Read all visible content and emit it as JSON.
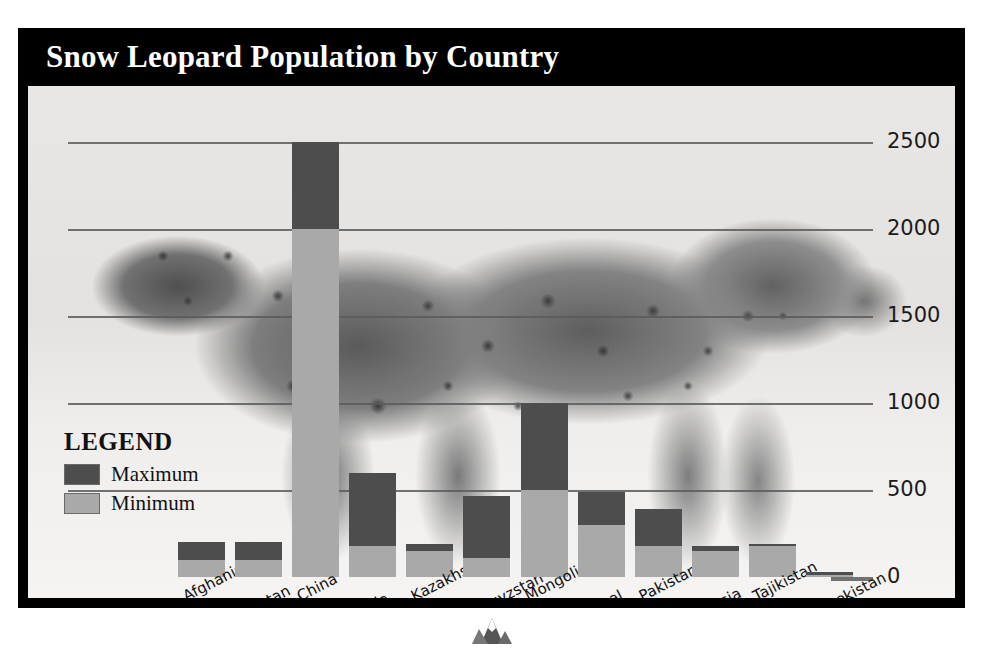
{
  "poster": {
    "title": "Snow Leopard Population by Country",
    "frame_color": "#000000",
    "title_band_color": "#000000",
    "title_text_color": "#ffffff",
    "panel_background": "#f2f0ee",
    "background_image_subject": "snow-leopard-photograph"
  },
  "legend": {
    "heading": "LEGEND",
    "items": [
      {
        "label": "Maximum",
        "color": "#4d4d4d"
      },
      {
        "label": "Minimum",
        "color": "#a9a9a9"
      }
    ]
  },
  "axis": {
    "y_ticks": [
      "0",
      "500",
      "1000",
      "1500",
      "2000",
      "2500"
    ],
    "y_tick_color": "#1a1a1a",
    "gridline_color": "#5a5a5a"
  },
  "chart_data": {
    "type": "bar",
    "title": "Snow Leopard Population by Country",
    "xlabel": "",
    "ylabel": "",
    "ylim": [
      0,
      2500
    ],
    "yticks": [
      0,
      500,
      1000,
      1500,
      2000,
      2500
    ],
    "grid": true,
    "stacked": true,
    "legend_position": "inside-left",
    "categories": [
      "Afghanistan",
      "Bhutan",
      "China",
      "India",
      "Kazakhstan",
      "Kyrgyzstan",
      "Mongolia",
      "Nepal",
      "Pakistan",
      "Russia",
      "Tajikistan",
      "Uzbekistan"
    ],
    "series": [
      {
        "name": "Minimum",
        "color": "#a9a9a9",
        "values": [
          100,
          100,
          2000,
          180,
          150,
          110,
          500,
          300,
          180,
          150,
          180,
          10
        ]
      },
      {
        "name": "Maximum",
        "color": "#4d4d4d",
        "values": [
          200,
          200,
          2500,
          600,
          190,
          465,
          1000,
          490,
          390,
          180,
          190,
          30
        ]
      }
    ]
  }
}
